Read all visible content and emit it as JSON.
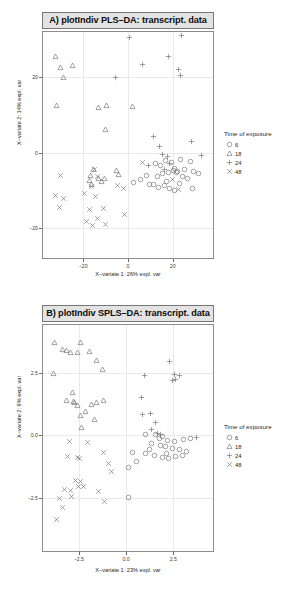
{
  "chart_data": [
    {
      "id": "A",
      "type": "scatter",
      "title": "A) plotIndiv PLS–DA: transcript. data",
      "xlabel": "X−variate 1: 26% expl. var",
      "ylabel": "X−variate 2: 14% expl. var",
      "xlim": [
        -38,
        38
      ],
      "ylim": [
        -28,
        32
      ],
      "xticks": [
        -20,
        0,
        20
      ],
      "xticklabels": [
        "−20",
        "0",
        "20"
      ],
      "yticks": [
        -20,
        0,
        20
      ],
      "yticklabels": [
        "−20",
        "0",
        "20"
      ],
      "grid": true,
      "legend": {
        "title": "Time of exposure",
        "position": "right",
        "entries": [
          {
            "label": "6",
            "marker": "circle"
          },
          {
            "label": "18",
            "marker": "triangle"
          },
          {
            "label": "24",
            "marker": "plus"
          },
          {
            "label": "48",
            "marker": "cross"
          }
        ]
      },
      "series": [
        {
          "name": "6",
          "marker": "circle",
          "points": [
            [
              12.2,
              -2.8
            ],
            [
              14.5,
              -3.4
            ],
            [
              16.8,
              -2.1
            ],
            [
              19.5,
              -2.6
            ],
            [
              21.0,
              -4.2
            ],
            [
              23.5,
              -1.9
            ],
            [
              25.2,
              -4.6
            ],
            [
              27.8,
              -2.4
            ],
            [
              29.5,
              -5.0
            ],
            [
              13.0,
              -6.4
            ],
            [
              15.6,
              -5.6
            ],
            [
              17.4,
              -7.6
            ],
            [
              18.2,
              -5.2
            ],
            [
              20.4,
              -4.9
            ],
            [
              21.6,
              -5.4
            ],
            [
              22.0,
              -5.1
            ],
            [
              24.5,
              -6.3
            ],
            [
              11.2,
              -8.5
            ],
            [
              13.8,
              -9.2
            ],
            [
              16.2,
              -8.8
            ],
            [
              18.6,
              -9.6
            ],
            [
              20.8,
              -10.2
            ],
            [
              23.0,
              -8.1
            ],
            [
              26.4,
              -6.9
            ],
            [
              5.6,
              -7.2
            ],
            [
              8.4,
              -6.2
            ],
            [
              9.8,
              -8.4
            ],
            [
              2.6,
              -8.0
            ],
            [
              29.0,
              -9.5
            ],
            [
              31.5,
              -5.5
            ]
          ]
        },
        {
          "name": "18",
          "marker": "triangle",
          "points": [
            [
              -32.5,
              25.5
            ],
            [
              -30.2,
              22.5
            ],
            [
              -28.8,
              20.0
            ],
            [
              -25.0,
              23.0
            ],
            [
              -31.8,
              12.5
            ],
            [
              -13.0,
              12.0
            ],
            [
              -9.5,
              12.6
            ],
            [
              -10.0,
              6.0
            ],
            [
              -15.5,
              -4.5
            ],
            [
              -16.8,
              -6.2
            ],
            [
              -17.2,
              -7.4
            ],
            [
              -16.4,
              -8.6
            ],
            [
              -13.4,
              -6.8
            ],
            [
              -12.0,
              -7.8
            ],
            [
              -10.6,
              -7.0
            ],
            [
              -5.2,
              -4.8
            ],
            [
              -4.4,
              -5.8
            ],
            [
              2.0,
              12.2
            ]
          ]
        },
        {
          "name": "24",
          "marker": "plus",
          "points": [
            [
              0.5,
              30.5
            ],
            [
              24.0,
              31.0
            ],
            [
              6.5,
              23.5
            ],
            [
              18.0,
              25.5
            ],
            [
              22.5,
              22.0
            ],
            [
              23.5,
              20.5
            ],
            [
              -5.5,
              20.0
            ],
            [
              11.5,
              4.2
            ],
            [
              14.0,
              1.5
            ],
            [
              15.5,
              -0.5
            ],
            [
              17.5,
              -1.0
            ],
            [
              18.5,
              -2.8
            ],
            [
              9.0,
              -3.5
            ],
            [
              28.5,
              3.0
            ],
            [
              33.0,
              -0.8
            ],
            [
              16.5,
              -4.5
            ]
          ]
        },
        {
          "name": "48",
          "marker": "cross",
          "points": [
            [
              -30.0,
              -6.0
            ],
            [
              -32.2,
              -11.5
            ],
            [
              -29.0,
              -12.2
            ],
            [
              -30.8,
              -14.5
            ],
            [
              -19.5,
              -11.0
            ],
            [
              -15.0,
              -4.6
            ],
            [
              -13.8,
              -6.4
            ],
            [
              -14.5,
              -11.6
            ],
            [
              -17.0,
              -15.0
            ],
            [
              -18.5,
              -18.2
            ],
            [
              -16.0,
              -19.5
            ],
            [
              -13.5,
              -17.5
            ],
            [
              -11.0,
              -14.8
            ],
            [
              -10.2,
              -19.0
            ],
            [
              -4.5,
              -8.8
            ],
            [
              -2.0,
              -9.6
            ],
            [
              -1.4,
              -16.5
            ],
            [
              6.5,
              -2.6
            ],
            [
              20.0,
              -7.2
            ],
            [
              22.5,
              -9.8
            ],
            [
              -16.2,
              -9.0
            ]
          ]
        }
      ]
    },
    {
      "id": "B",
      "type": "scatter",
      "title": "B) plotIndiv SPLS–DA: transcript. data",
      "xlabel": "X−variate 1: 23% expl. var",
      "ylabel": "X−variate 2: 9% expl. var",
      "xlim": [
        -4.4,
        4.6
      ],
      "ylim": [
        -4.6,
        4.4
      ],
      "xticks": [
        -2.5,
        0.0,
        2.5
      ],
      "xticklabels": [
        "−2.5",
        "0.0",
        "2.5"
      ],
      "yticks": [
        -2.5,
        0.0,
        2.5
      ],
      "yticklabels": [
        "−2.5",
        "0.0",
        "2.5"
      ],
      "grid": true,
      "legend": {
        "title": "Time of exposure",
        "position": "right",
        "entries": [
          {
            "label": "6",
            "marker": "circle"
          },
          {
            "label": "18",
            "marker": "triangle"
          },
          {
            "label": "24",
            "marker": "plus"
          },
          {
            "label": "48",
            "marker": "cross"
          }
        ]
      },
      "series": [
        {
          "name": "6",
          "marker": "circle",
          "points": [
            [
              1.05,
              0.05
            ],
            [
              1.55,
              0.02
            ],
            [
              1.75,
              -0.12
            ],
            [
              1.95,
              -0.05
            ],
            [
              2.2,
              -0.18
            ],
            [
              2.55,
              -0.22
            ],
            [
              3.05,
              -0.15
            ],
            [
              3.4,
              -0.1
            ],
            [
              1.35,
              -0.3
            ],
            [
              1.8,
              -0.4
            ],
            [
              2.1,
              -0.45
            ],
            [
              2.45,
              -0.5
            ],
            [
              2.8,
              -0.55
            ],
            [
              3.2,
              -0.62
            ],
            [
              1.0,
              -0.72
            ],
            [
              1.5,
              -0.8
            ],
            [
              1.9,
              -0.86
            ],
            [
              2.25,
              -0.92
            ],
            [
              2.6,
              -0.82
            ],
            [
              3.0,
              -0.78
            ],
            [
              0.35,
              -0.68
            ],
            [
              0.55,
              -1.05
            ],
            [
              0.15,
              -1.28
            ],
            [
              0.1,
              -2.45
            ],
            [
              2.15,
              -0.72
            ],
            [
              1.25,
              -0.55
            ]
          ]
        },
        {
          "name": "18",
          "marker": "triangle",
          "points": [
            [
              -3.8,
              3.7
            ],
            [
              -3.35,
              3.42
            ],
            [
              -3.15,
              3.38
            ],
            [
              -2.95,
              3.32
            ],
            [
              -2.4,
              3.72
            ],
            [
              -1.95,
              3.35
            ],
            [
              -2.6,
              3.3
            ],
            [
              -1.55,
              3.0
            ],
            [
              -1.25,
              2.62
            ],
            [
              -3.85,
              2.45
            ],
            [
              -2.85,
              1.72
            ],
            [
              -3.15,
              1.4
            ],
            [
              -2.8,
              1.35
            ],
            [
              -2.75,
              1.32
            ],
            [
              -2.55,
              1.2
            ],
            [
              -2.4,
              0.78
            ],
            [
              -2.35,
              0.3
            ],
            [
              -2.15,
              0.95
            ],
            [
              -1.85,
              1.25
            ],
            [
              -1.65,
              0.62
            ],
            [
              -1.55,
              1.3
            ],
            [
              -1.2,
              1.38
            ]
          ]
        },
        {
          "name": "24",
          "marker": "plus",
          "points": [
            [
              2.3,
              2.95
            ],
            [
              2.55,
              2.42
            ],
            [
              2.8,
              2.4
            ],
            [
              2.45,
              2.18
            ],
            [
              0.95,
              2.4
            ],
            [
              0.8,
              1.5
            ],
            [
              0.85,
              0.82
            ],
            [
              1.3,
              0.88
            ],
            [
              1.55,
              0.5
            ],
            [
              1.35,
              0.25
            ],
            [
              1.65,
              0.08
            ],
            [
              1.8,
              0.02
            ],
            [
              3.75,
              -0.08
            ],
            [
              2.6,
              2.22
            ]
          ]
        },
        {
          "name": "48",
          "marker": "cross",
          "points": [
            [
              -3.0,
              -0.25
            ],
            [
              -2.05,
              -0.28
            ],
            [
              -3.1,
              -0.85
            ],
            [
              -2.55,
              -0.88
            ],
            [
              -2.45,
              -0.9
            ],
            [
              -1.2,
              -0.68
            ],
            [
              -0.95,
              -1.1
            ],
            [
              -0.8,
              -1.42
            ],
            [
              -2.7,
              -1.8
            ],
            [
              -2.4,
              -1.85
            ],
            [
              -2.5,
              -2.05
            ],
            [
              -2.95,
              -2.2
            ],
            [
              -3.25,
              -2.15
            ],
            [
              -3.55,
              -2.52
            ],
            [
              -3.35,
              -2.85
            ],
            [
              -2.9,
              -2.42
            ],
            [
              -3.7,
              -3.35
            ],
            [
              -1.45,
              -2.25
            ],
            [
              -1.15,
              -2.62
            ],
            [
              -2.25,
              -2.05
            ]
          ]
        }
      ]
    }
  ]
}
